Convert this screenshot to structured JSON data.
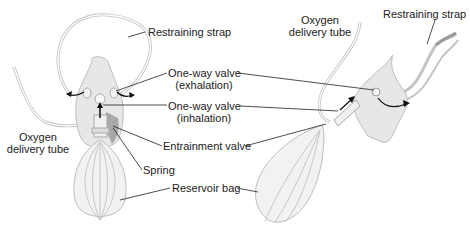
{
  "diagram": {
    "views": [
      "front-view",
      "side-view"
    ],
    "labels": {
      "restraining_strap_left": "Restraining strap",
      "exhalation_valve_line1": "One-way valve",
      "exhalation_valve_line2": "(exhalation)",
      "inhalation_valve_line1": "One-way valve",
      "inhalation_valve_line2": "(inhalation)",
      "oxygen_tube_left_line1": "Oxygen",
      "oxygen_tube_left_line2": "delivery tube",
      "entrainment_valve": "Entrainment valve",
      "spring": "Spring",
      "reservoir_bag": "Reservoir bag",
      "oxygen_tube_right_line1": "Oxygen",
      "oxygen_tube_right_line2": "delivery tube",
      "restraining_strap_right": "Restraining strap"
    },
    "colors": {
      "mask_fill": "#e6e6e6",
      "outline": "#b5b5b5",
      "leader_line": "#222222",
      "shadow": "#a8a8a8",
      "arrow": "#111111"
    }
  }
}
